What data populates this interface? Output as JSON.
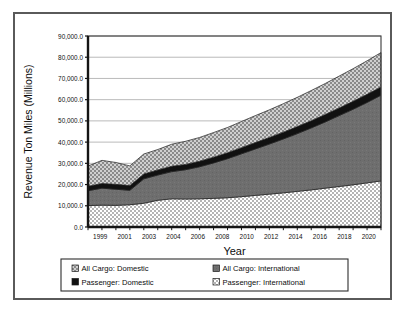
{
  "chart_data": {
    "type": "area",
    "stacked": true,
    "title": "",
    "xlabel": "Year",
    "ylabel": "Revenue Ton Miles (Millions)",
    "x": [
      1999,
      2000,
      2001,
      2002,
      2003,
      2004,
      2005,
      2006,
      2007,
      2008,
      2009,
      2010,
      2011,
      2012,
      2013,
      2014,
      2015,
      2016,
      2017,
      2018,
      2019,
      2020
    ],
    "xtick_labels": [
      "1999",
      "2001",
      "2003",
      "2004",
      "2006",
      "2008",
      "2010",
      "2012",
      "2014",
      "2016",
      "2018",
      "2020"
    ],
    "xlim": [
      1999,
      2020
    ],
    "ylim": [
      0,
      90000
    ],
    "ytick_labels": [
      "0.0",
      "10,000.0",
      "20,000.0",
      "30,000.0",
      "40,000.0",
      "50,000.0",
      "60,000.0",
      "70,000.0",
      "80,000.0",
      "90,000.0"
    ],
    "ytick_values": [
      0,
      10000,
      20000,
      30000,
      40000,
      50000,
      60000,
      70000,
      80000,
      90000
    ],
    "grid": true,
    "grid_axis": "y",
    "legend_position": "bottom",
    "series": [
      {
        "name": "Passenger: International",
        "pattern": "light-checker",
        "color": "#c9c9c9",
        "values": [
          10100,
          10300,
          10200,
          10500,
          11200,
          12600,
          13300,
          13200,
          13300,
          13500,
          13800,
          14300,
          14900,
          15500,
          16100,
          16800,
          17500,
          18300,
          19100,
          19900,
          20800,
          21700
        ]
      },
      {
        "name": "All Cargo: International",
        "pattern": "solid-dark",
        "color": "#6e6e6e",
        "values": [
          7000,
          8000,
          7600,
          6800,
          11500,
          11900,
          12800,
          13800,
          15100,
          16700,
          18400,
          20200,
          21900,
          23600,
          25400,
          27200,
          29200,
          31200,
          33400,
          35600,
          37900,
          40400
        ]
      },
      {
        "name": "Passenger: Domestic",
        "pattern": "solid-black",
        "color": "#101010",
        "values": [
          2100,
          2200,
          2300,
          2200,
          2300,
          2400,
          2500,
          2500,
          2600,
          2700,
          2800,
          2900,
          3000,
          3100,
          3200,
          3300,
          3400,
          3500,
          3600,
          3700,
          3800,
          3900
        ]
      },
      {
        "name": "All Cargo: Domestic",
        "pattern": "medium-checker",
        "color": "#9a9a9a",
        "values": [
          9500,
          10900,
          10300,
          9300,
          9400,
          9600,
          10400,
          10900,
          11200,
          11600,
          11900,
          12300,
          12700,
          13000,
          13400,
          13800,
          14200,
          14600,
          15000,
          15400,
          15800,
          16200
        ]
      }
    ]
  },
  "axes": {
    "ylabel": "Revenue Ton Miles (Millions)",
    "xlabel": "Year"
  },
  "legend": {
    "items": [
      {
        "label": "All Cargo: Domestic",
        "swatch": "medium-checker"
      },
      {
        "label": "All Cargo: International",
        "swatch": "solid-dark"
      },
      {
        "label": "Passenger: Domestic",
        "swatch": "solid-black"
      },
      {
        "label": "Passenger: International",
        "swatch": "light-checker"
      }
    ]
  }
}
